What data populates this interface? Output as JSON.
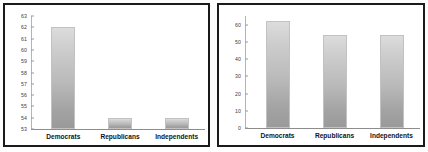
{
  "chart_data": [
    {
      "type": "bar",
      "title": "",
      "xlabel": "",
      "ylabel": "",
      "categories": [
        "Democrats",
        "Republicans",
        "Independents"
      ],
      "values": [
        62,
        54,
        54
      ],
      "ylim": [
        53,
        63
      ],
      "yticks": [
        53,
        54,
        55,
        56,
        57,
        58,
        59,
        60,
        61,
        62,
        63
      ],
      "ytick_labels": [
        "53",
        "54",
        "55",
        "56",
        "57",
        "58",
        "59",
        "60",
        "61",
        "62",
        "63"
      ],
      "grid": false,
      "legend": "none",
      "bar_color": "#b9b9b9",
      "panel_border_color": "#1a1a1a",
      "background": "#ffffff"
    },
    {
      "type": "bar",
      "title": "",
      "xlabel": "",
      "ylabel": "",
      "categories": [
        "Democrats",
        "Republicans",
        "Independents"
      ],
      "values": [
        62,
        54,
        54
      ],
      "ylim": [
        0,
        65
      ],
      "yticks": [
        0,
        10,
        20,
        30,
        40,
        50,
        60
      ],
      "ytick_labels": [
        "0",
        "10",
        "20",
        "30",
        "40",
        "50",
        "60"
      ],
      "grid": false,
      "legend": "none",
      "bar_color": "#b9b9b9",
      "panel_border_color": "#1a1a1a",
      "background": "#ffffff"
    }
  ],
  "panels": [
    {
      "name": "truncated-axis-chart",
      "ticks": [
        {
          "label": "63",
          "value": 63
        },
        {
          "label": "62",
          "value": 62
        },
        {
          "label": "61",
          "value": 61
        },
        {
          "label": "60",
          "value": 60
        },
        {
          "label": "59",
          "value": 59
        },
        {
          "label": "58",
          "value": 58
        },
        {
          "label": "57",
          "value": 57
        },
        {
          "label": "56",
          "value": 56
        },
        {
          "label": "55",
          "value": 55
        },
        {
          "label": "54",
          "value": 54
        },
        {
          "label": "53",
          "value": 53
        }
      ],
      "bars": [
        {
          "label": "Democrats",
          "value": 62
        },
        {
          "label": "Republicans",
          "value": 54
        },
        {
          "label": "Independents",
          "value": 54
        }
      ]
    },
    {
      "name": "full-axis-chart",
      "ticks": [
        {
          "label": "60",
          "value": 60
        },
        {
          "label": "50",
          "value": 50
        },
        {
          "label": "40",
          "value": 40
        },
        {
          "label": "30",
          "value": 30
        },
        {
          "label": "20",
          "value": 20
        },
        {
          "label": "10",
          "value": 10
        },
        {
          "label": "0",
          "value": 0
        }
      ],
      "bars": [
        {
          "label": "Democrats",
          "value": 62
        },
        {
          "label": "Republicans",
          "value": 54
        },
        {
          "label": "Independents",
          "value": 54
        }
      ]
    }
  ]
}
